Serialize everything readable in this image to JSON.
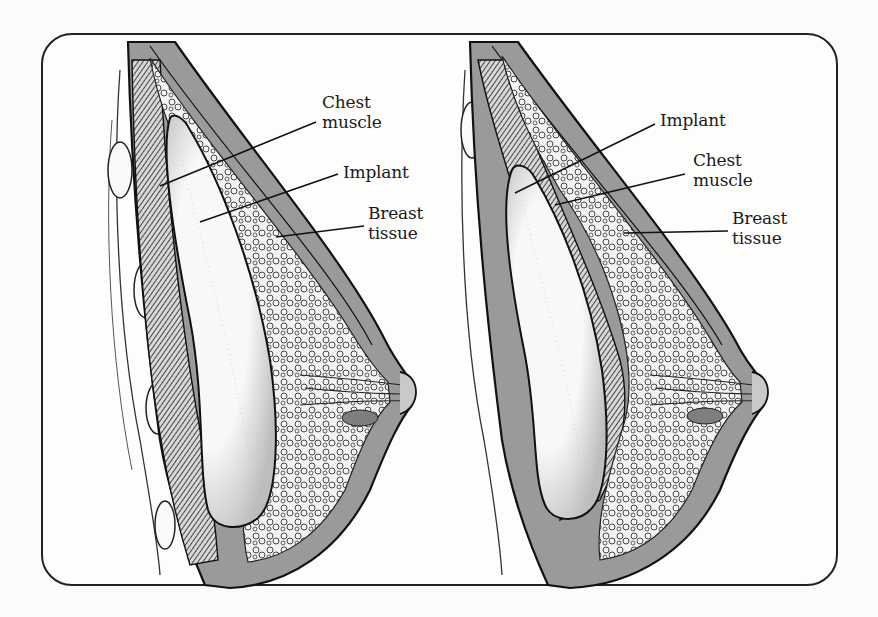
{
  "figure": {
    "frame": {
      "x": 42,
      "y": 34,
      "width": 795,
      "height": 551,
      "radius": 30,
      "stroke": "#222222"
    },
    "colors": {
      "ink": "#1a1a1a",
      "tissue_gray": "#8c8c8c",
      "fat_gray": "#a9a9a9",
      "implant": "#f7f7f5",
      "background": "#fbfbfa"
    }
  },
  "panels": [
    {
      "id": "left",
      "description": "Implant placed beneath the chest muscle (submuscular)",
      "labels": [
        {
          "lines": [
            "Chest",
            "muscle"
          ],
          "x": 322,
          "y": 92
        },
        {
          "lines": [
            "Implant"
          ],
          "x": 343,
          "y": 162
        },
        {
          "lines": [
            "Breast",
            "tissue"
          ],
          "x": 368,
          "y": 203
        }
      ]
    },
    {
      "id": "right",
      "description": "Implant placed in front of the chest muscle, beneath breast tissue (subglandular)",
      "labels": [
        {
          "lines": [
            "Implant"
          ],
          "x": 660,
          "y": 110
        },
        {
          "lines": [
            "Chest",
            "muscle"
          ],
          "x": 693,
          "y": 150
        },
        {
          "lines": [
            "Breast",
            "tissue"
          ],
          "x": 732,
          "y": 208
        }
      ]
    }
  ]
}
